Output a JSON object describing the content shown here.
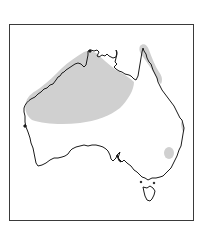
{
  "map": {
    "title": "Species distribution map — Australia",
    "region": "Australia",
    "frame": {
      "border_color": "#3a3a3a",
      "background": "#ffffff"
    },
    "coastline": {
      "stroke": "#1a1a1a"
    },
    "distribution": {
      "fill": "#d0d0d0",
      "areas": [
        {
          "name": "Northern Australia band (Kimberley to Gulf of Carpentaria)"
        },
        {
          "name": "Eastern Cape York coastal strip"
        },
        {
          "name": "Central Queensland coast fringe"
        },
        {
          "name": "Northern New South Wales coastal patch"
        }
      ]
    }
  }
}
